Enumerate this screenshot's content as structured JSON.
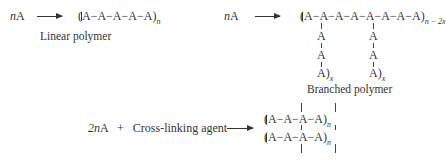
{
  "linear": {
    "reactant_coef": "n",
    "reactant": "A",
    "product": "(A−A−A−A−A)",
    "product_subscript": "n",
    "label": "Linear polymer"
  },
  "branched": {
    "reactant_coef": "n",
    "reactant": "A",
    "product_main": "(A−A−A−A−A−A−A−A)",
    "product_subscript": "n − 2x",
    "branch_units": [
      "A",
      "A",
      "A)"
    ],
    "branch_subscript": "x",
    "label": "Branched polymer"
  },
  "crosslinked": {
    "reactant_coef": "2n",
    "reactant": "A",
    "plus": "+",
    "agent": "Cross-linking agent",
    "chain_top": "(A−A−A−A)",
    "chain_bottom": "(A−A−A−A)",
    "chain_subscript": "n"
  }
}
